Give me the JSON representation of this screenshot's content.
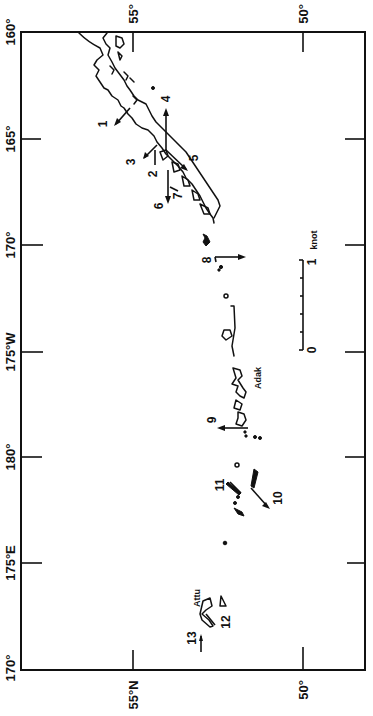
{
  "map": {
    "type": "current-vector map",
    "region": "Aleutian Islands",
    "longitude_labels": [
      "160°",
      "165°",
      "170°",
      "175°W",
      "180°",
      "175°E",
      "170°"
    ],
    "latitude_labels_top": [
      "55°",
      "50°"
    ],
    "latitude_labels_bottom": [
      "55°N",
      "50°"
    ],
    "place_names": [
      "Adak",
      "Attu"
    ],
    "stations": [
      {
        "id": "1",
        "label": "1"
      },
      {
        "id": "2",
        "label": "2"
      },
      {
        "id": "3",
        "label": "3"
      },
      {
        "id": "4",
        "label": "4"
      },
      {
        "id": "5",
        "label": "5"
      },
      {
        "id": "6",
        "label": "6"
      },
      {
        "id": "7",
        "label": "7"
      },
      {
        "id": "8",
        "label": "8"
      },
      {
        "id": "9",
        "label": "9"
      },
      {
        "id": "10",
        "label": "10"
      },
      {
        "id": "11",
        "label": "11"
      },
      {
        "id": "12",
        "label": "12"
      },
      {
        "id": "13",
        "label": "13"
      }
    ],
    "scale": {
      "unit_label": "knot",
      "min_label": "0",
      "max_label": "1",
      "max_value_knots": 1,
      "subdivisions": 5
    }
  }
}
